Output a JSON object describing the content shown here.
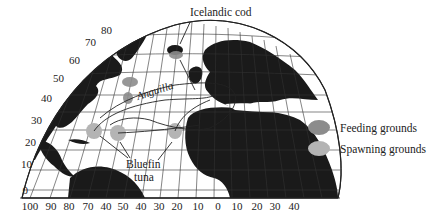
{
  "map": {
    "type": "projection-map",
    "subject": "North Atlantic fish migrations",
    "latitude_labels": [
      "80",
      "70",
      "60",
      "50",
      "40",
      "30",
      "20",
      "10",
      "0"
    ],
    "longitude_labels": [
      "100",
      "90",
      "80",
      "70",
      "40",
      "50",
      "40",
      "30",
      "20",
      "10",
      "0",
      "10",
      "20",
      "30",
      "40"
    ],
    "annotations": {
      "icelandic_cod": "Icelandic cod",
      "anguilla": "Anguilla",
      "bluefin_line1": "Bluefin",
      "bluefin_line2": "tuna"
    },
    "colors": {
      "land": "#1a1a1a",
      "ocean": "#ffffff",
      "grid": "#333333",
      "feeding": "#8c8c8c",
      "spawning": "#b4b4b4"
    }
  },
  "legend": {
    "items": [
      {
        "label": "Feeding grounds",
        "color": "#8c8c8c"
      },
      {
        "label": "Spawning grounds",
        "color": "#b4b4b4"
      }
    ]
  }
}
